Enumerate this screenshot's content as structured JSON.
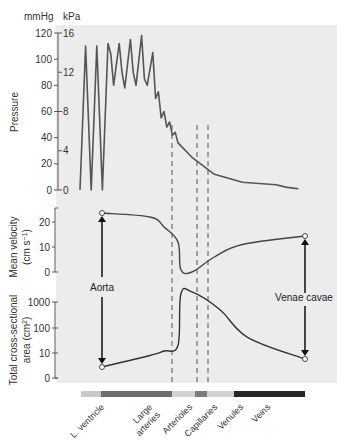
{
  "chart_data": [
    {
      "type": "line",
      "title": "Pressure",
      "ylabel": "Pressure",
      "y_units_left": "mmHg",
      "y_units_right": "kPa",
      "ylim": [
        0,
        120
      ],
      "yticks_mmHg": [
        "0",
        "20",
        "40",
        "60",
        "80",
        "100",
        "120"
      ],
      "yticks_kPa": [
        "0",
        "4",
        "8",
        "12",
        "16"
      ],
      "description": "Pulsatile pressure: L. ventricle oscillates 0-110 mmHg; large arteries oscillate ~80-120 mmHg; pressure falls through arterioles to ~35 mmHg, then declines smoothly through capillaries and venules to near 0 in veins with small oscillations",
      "series": [
        {
          "name": "Pressure (mmHg)",
          "points": [
            [
              0,
              0
            ],
            [
              2,
              110
            ],
            [
              4,
              0
            ],
            [
              6,
              110
            ],
            [
              8,
              0
            ],
            [
              10,
              112
            ],
            [
              11,
              104
            ],
            [
              12,
              80
            ],
            [
              14,
              112
            ],
            [
              15,
              90
            ],
            [
              16,
              78
            ],
            [
              18,
              115
            ],
            [
              19,
              90
            ],
            [
              20,
              80
            ],
            [
              22,
              118
            ],
            [
              23,
              85
            ],
            [
              24,
              80
            ],
            [
              26,
              105
            ],
            [
              27,
              70
            ],
            [
              28,
              75
            ],
            [
              29,
              55
            ],
            [
              30,
              60
            ],
            [
              31,
              48
            ],
            [
              32,
              52
            ],
            [
              33,
              42
            ],
            [
              34,
              44
            ],
            [
              35,
              36
            ],
            [
              40,
              25
            ],
            [
              48,
              12
            ],
            [
              58,
              6
            ],
            [
              70,
              4
            ],
            [
              74,
              2
            ],
            [
              78,
              1
            ]
          ]
        }
      ]
    },
    {
      "type": "line",
      "ylabel": "Mean velocity (cm s⁻¹)",
      "ylim": [
        0,
        25
      ],
      "yticks": [
        "0",
        "10",
        "20"
      ],
      "series": [
        {
          "name": "Mean velocity",
          "points": [
            [
              10,
              24
            ],
            [
              25,
              22
            ],
            [
              30,
              18
            ],
            [
              35,
              12
            ],
            [
              36,
              1
            ],
            [
              40,
              0
            ],
            [
              48,
              6
            ],
            [
              58,
              11
            ],
            [
              66,
              12
            ]
          ]
        }
      ]
    },
    {
      "type": "line",
      "ylabel": "Total cross-sectional area (cm²)",
      "yscale": "log",
      "yticks": [
        "0",
        "10",
        "100",
        "1000"
      ],
      "series": [
        {
          "name": "Total cross-sectional area",
          "points": [
            [
              10,
              4
            ],
            [
              25,
              8
            ],
            [
              30,
              12
            ],
            [
              35,
              20
            ],
            [
              36,
              2000
            ],
            [
              40,
              2500
            ],
            [
              50,
              500
            ],
            [
              60,
              40
            ],
            [
              66,
              8
            ]
          ]
        }
      ]
    }
  ],
  "units": {
    "mmHg": "mmHg",
    "kPa": "kPa"
  },
  "axes": {
    "pressure": {
      "title": "Pressure",
      "mmHg_ticks": [
        "0",
        "20",
        "40",
        "60",
        "80",
        "100",
        "120"
      ],
      "kPa_ticks": [
        "0",
        "4",
        "8",
        "12",
        "16"
      ]
    },
    "velocity": {
      "title_line1": "Mean velocity",
      "title_line2": "(cm s",
      "title_sup": "−1",
      "title_end": ")",
      "ticks": [
        "0",
        "10",
        "20"
      ]
    },
    "area": {
      "title_line1": "Total cross-sectional",
      "title_line2": "area (cm",
      "title_sup": "2",
      "title_end": ")",
      "ticks": [
        "0",
        "10",
        "100",
        "1000"
      ]
    }
  },
  "annotations": {
    "aorta": "Aorta",
    "venae_cavae": "Venae cavae"
  },
  "segments": [
    {
      "label": "L. ventricle",
      "color": "#c8c8c8"
    },
    {
      "label": "Large arteries",
      "color": "#6e6e6e"
    },
    {
      "label": "Arterioles",
      "color": "#d2d2d2"
    },
    {
      "label": "Capillaries",
      "color": "#7a7a7a"
    },
    {
      "label": "Venules",
      "color": "#d2d2d2"
    },
    {
      "label": "Veins",
      "color": "#262626"
    }
  ],
  "segment_label_lines": [
    [
      "L. ventricle"
    ],
    [
      "Large",
      "arteries"
    ],
    [
      "Arterioles"
    ],
    [
      "Capillaries"
    ],
    [
      "Venules"
    ],
    [
      "Veins"
    ]
  ],
  "colors": {
    "plot_bg": "#ececec",
    "line": "#3a3a3a",
    "axis": "#555555",
    "dashed": "#555555"
  }
}
